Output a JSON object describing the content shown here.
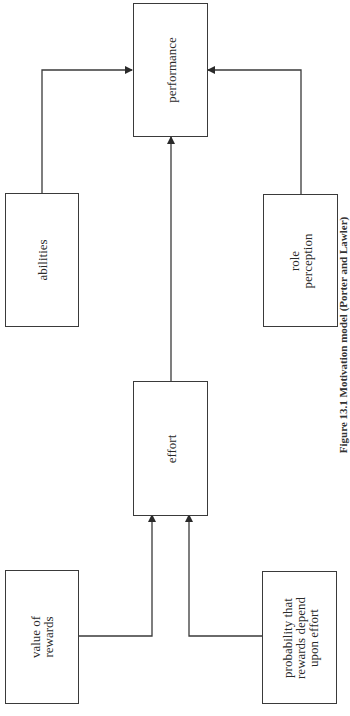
{
  "figure": {
    "orientation": "rotated -90deg (landscape page shown sideways)",
    "caption": "Figure 13.1 Motivation model (Porter and Lawler)"
  },
  "nodes": {
    "performance": {
      "label": "performance"
    },
    "abilities": {
      "label": "abilities"
    },
    "role_perception": {
      "label": "role\nperception",
      "line1": "role",
      "line2": "perception"
    },
    "effort": {
      "label": "effort"
    },
    "value_of_rewards": {
      "label": "value of rewards",
      "line1": "value of",
      "line2": "rewards"
    },
    "probability": {
      "label": "probability that rewards depend upon effort",
      "line1": "probability that",
      "line2": "rewards depend",
      "line3": "upon effort"
    }
  },
  "edges": [
    {
      "from": "value_of_rewards",
      "to": "effort"
    },
    {
      "from": "probability",
      "to": "effort"
    },
    {
      "from": "effort",
      "to": "performance"
    },
    {
      "from": "abilities",
      "to": "performance"
    },
    {
      "from": "role_perception",
      "to": "performance"
    }
  ],
  "colors": {
    "line": "#3a3a3a",
    "background": "#ffffff"
  }
}
